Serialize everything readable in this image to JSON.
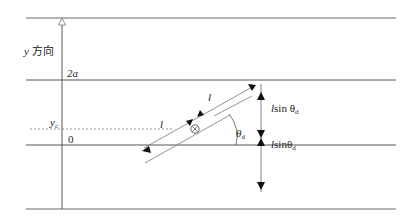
{
  "labels": {
    "y_axis": "y 方向",
    "y_axis_var": "y",
    "y_axis_text": "方向",
    "top_level": "2a",
    "yc": "y",
    "yc_sub": "c",
    "origin": "0",
    "l_upper": "l",
    "l_lower": "l",
    "theta": "θ",
    "theta_sub": "d",
    "lsin_upper_l": "l",
    "lsin_upper_text": "sin θ",
    "lsin_upper_sub": "d",
    "lsin_lower_l": "l",
    "lsin_lower_text": "sinθ",
    "lsin_lower_sub": "d"
  },
  "colors": {
    "line": "#555555",
    "thin": "#777777",
    "arrow": "#111111",
    "text": "#222222"
  }
}
